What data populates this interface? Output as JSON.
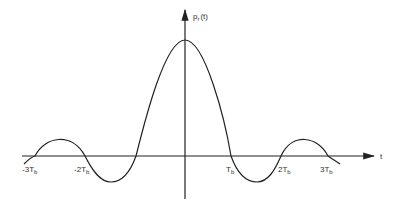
{
  "diagram": {
    "y_axis_label": {
      "main": "p",
      "sub": "r",
      "arg": "(t)"
    },
    "x_axis_label": "t",
    "tick_labels": [
      {
        "id": "neg3",
        "prefix": "-3",
        "sym": "T",
        "sub": "b"
      },
      {
        "id": "neg2",
        "prefix": "-2",
        "sym": "T",
        "sub": "b"
      },
      {
        "id": "pos1",
        "prefix": "",
        "sym": "T",
        "sub": "b"
      },
      {
        "id": "pos2",
        "prefix": "2",
        "sym": "T",
        "sub": "b"
      },
      {
        "id": "pos3",
        "prefix": "3",
        "sym": "T",
        "sub": "b"
      }
    ],
    "colors": {
      "stroke": "#222222",
      "background": "#ffffff"
    }
  }
}
